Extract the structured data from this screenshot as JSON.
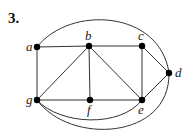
{
  "problem_number": "3.",
  "graph": {
    "nodes": [
      {
        "id": "a",
        "x": 37,
        "y": 47,
        "lx": 26,
        "ly": 51
      },
      {
        "id": "b",
        "x": 89,
        "y": 46,
        "lx": 85,
        "ly": 40
      },
      {
        "id": "c",
        "x": 142,
        "y": 46,
        "lx": 138,
        "ly": 40
      },
      {
        "id": "d",
        "x": 169,
        "y": 73,
        "lx": 175,
        "ly": 77
      },
      {
        "id": "e",
        "x": 142,
        "y": 100,
        "lx": 138,
        "ly": 114
      },
      {
        "id": "f",
        "x": 90,
        "y": 100,
        "lx": 87,
        "ly": 114
      },
      {
        "id": "g",
        "x": 37,
        "y": 100,
        "lx": 26,
        "ly": 104
      }
    ],
    "straight_edges": [
      [
        "a",
        "b"
      ],
      [
        "b",
        "c"
      ],
      [
        "c",
        "d"
      ],
      [
        "c",
        "e"
      ],
      [
        "d",
        "e"
      ],
      [
        "a",
        "g"
      ],
      [
        "g",
        "b"
      ],
      [
        "b",
        "f"
      ],
      [
        "b",
        "e"
      ],
      [
        "g",
        "f"
      ],
      [
        "f",
        "e"
      ]
    ],
    "curved_edges": [
      {
        "from": "a",
        "to": "d",
        "path": "M37,47 C70,5 160,10 169,73"
      },
      {
        "from": "g",
        "to": "e",
        "path": "M37,100 C60,125 120,128 142,100"
      },
      {
        "from": "g",
        "to": "d",
        "path": "M37,100 C70,145 170,140 169,73"
      }
    ]
  }
}
